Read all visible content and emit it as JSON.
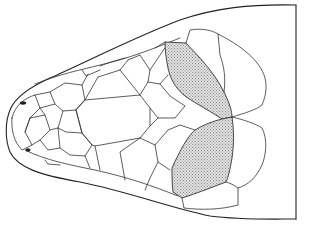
{
  "figure": {
    "shaded_scales": [
      "parietal-upper",
      "parietal-lower"
    ],
    "colors": {
      "line": "#222222",
      "stipple": "#9a9a9a",
      "background": "#ffffff"
    }
  }
}
